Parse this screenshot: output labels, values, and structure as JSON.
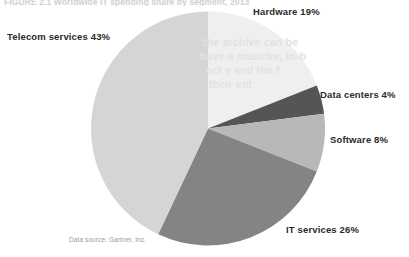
{
  "figure": {
    "caption": "FIGURE 2.1  Worldwide IT spending share by segment, 2013",
    "source_note": "Data source: Gartner, Inc."
  },
  "bleed_through": {
    "line1": "the archive can be",
    "line2": "have a massive, in-b",
    "line3": "ect  y and the  f",
    "line4": "their ent"
  },
  "chart_data": {
    "type": "pie",
    "title": "FIGURE 2.1  Worldwide IT spending share by segment, 2013",
    "xlabel": "",
    "ylabel": "",
    "legend_position": "callout-labels",
    "grid": false,
    "total": 100,
    "unit": "%",
    "start_angle_deg": 0,
    "direction": "clockwise",
    "categories": [
      "Hardware",
      "Data centers",
      "Software",
      "IT services",
      "Telecom services"
    ],
    "values": [
      19,
      4,
      8,
      26,
      43
    ],
    "colors": [
      "#efefef",
      "#555555",
      "#b8b8b8",
      "#848484",
      "#d5d5d5"
    ],
    "slices": [
      {
        "name": "Hardware",
        "label": "Hardware 19%",
        "value": 19,
        "color": "#efefef",
        "start_deg": 0,
        "end_deg": 68.4
      },
      {
        "name": "Data centers",
        "label": "Data centers 4%",
        "value": 4,
        "color": "#555555",
        "start_deg": 68.4,
        "end_deg": 82.8
      },
      {
        "name": "Software",
        "label": "Software 8%",
        "value": 8,
        "color": "#b8b8b8",
        "start_deg": 82.8,
        "end_deg": 111.6
      },
      {
        "name": "IT services",
        "label": "IT services 26%",
        "value": 26,
        "color": "#848484",
        "start_deg": 111.6,
        "end_deg": 205.2
      },
      {
        "name": "Telecom services",
        "label": "Telecom services 43%",
        "value": 43,
        "color": "#d5d5d5",
        "start_deg": 205.2,
        "end_deg": 360
      }
    ]
  }
}
